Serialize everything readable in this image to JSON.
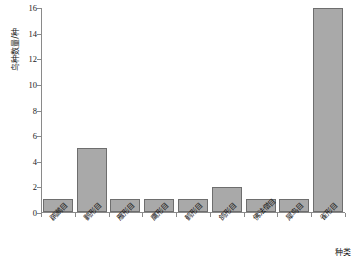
{
  "chart_data": {
    "type": "bar",
    "title": "",
    "xlabel": "种类",
    "ylabel": "鸟种数量/种",
    "categories": [
      "䴙䴘目",
      "鹳形目",
      "雁形目",
      "鹰形目",
      "鹤形目",
      "鸽形目",
      "佛法僧目",
      "犀鸟目",
      "雀形目"
    ],
    "values": [
      1,
      5,
      1,
      1,
      1,
      2,
      1,
      1,
      16
    ],
    "ylim": [
      0,
      16
    ],
    "ytick_values": [
      0,
      2,
      4,
      6,
      8,
      10,
      12,
      14,
      16
    ],
    "ytick_labels": [
      "0",
      "2",
      "4",
      "6",
      "8",
      "10",
      "12",
      "14",
      "16"
    ],
    "grid": false,
    "legend": null,
    "bar_fill_color": "#a9a9a9",
    "bar_border_color": "#6e6e6e",
    "axis_color": "#8a8a8a",
    "text_color": "#111111"
  }
}
